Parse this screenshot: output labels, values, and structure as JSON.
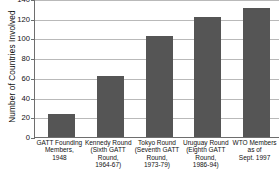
{
  "chart_data": {
    "type": "bar",
    "title": "",
    "xlabel": "",
    "ylabel": "Number of Countries Involved",
    "ylim": [
      0,
      140
    ],
    "ytick_step": 20,
    "yticks": [
      0,
      20,
      40,
      60,
      80,
      100,
      120,
      140
    ],
    "ytick_labels": [
      "0",
      "20",
      "40",
      "60",
      "80",
      "100",
      "120",
      "140"
    ],
    "grid": true,
    "legend": "none",
    "bar_color": "#555555",
    "categories": [
      "GATT Founding Members, 1948",
      "Kennedy Round (Sixth GATT Round, 1964-67)",
      "Tokyo Round (Seventh GATT Round, 1973-79)",
      "Uruguay Round (Eighth GATT Round, 1986-94)",
      "WTO Members as of Sept. 1997"
    ],
    "category_lines": [
      [
        "GATT Founding",
        "Members,",
        "1948"
      ],
      [
        "Kennedy Round",
        "(Sixth GATT",
        "Round,",
        "1964-67)"
      ],
      [
        "Tokyo Round",
        "(Seventh GATT",
        "Round,",
        "1973-79)"
      ],
      [
        "Uruguay Round",
        "(Eighth GATT",
        "Round,",
        "1986-94)"
      ],
      [
        "WTO Members",
        "as of",
        "Sept. 1997"
      ]
    ],
    "values": [
      23,
      62,
      102,
      122,
      131
    ]
  }
}
